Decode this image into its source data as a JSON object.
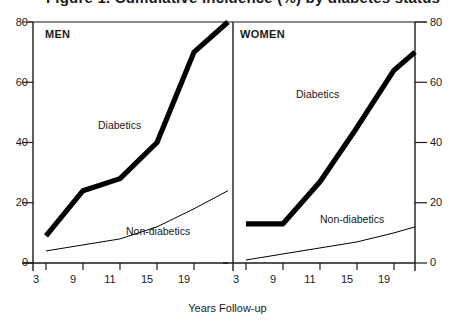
{
  "title": "Figure 1. Cumulative incidence (%) by diabetes status",
  "axis": {
    "y_ticks": [
      0,
      20,
      40,
      60,
      80
    ],
    "y_left_labels": [
      "0",
      "20",
      "40",
      "60",
      "80"
    ],
    "y_right_labels": [
      "0",
      "20",
      "40",
      "60",
      "80"
    ],
    "x_tick_labels": [
      "3",
      "9",
      "11",
      "15",
      "19"
    ],
    "x_title": "Years Follow-up"
  },
  "panels": {
    "men": {
      "title": "MEN",
      "label_diabetics": "Diabetics",
      "label_nondiabetics": "Non-diabetics"
    },
    "women": {
      "title": "WOMEN",
      "label_diabetics": "Diabetics",
      "label_nondiabetics": "Non-diabetics"
    }
  },
  "colors": {
    "line": "#000000",
    "axis": "#1a1a1a",
    "background": "#ffffff"
  },
  "chart_data": {
    "type": "line",
    "title": "Figure 1. Cumulative incidence (%) by diabetes status",
    "xlabel": "Years Follow-up",
    "ylabel": "",
    "ylim": [
      0,
      80
    ],
    "yticks": [
      0,
      20,
      40,
      60,
      80
    ],
    "grid": false,
    "legend": "inline-annotations",
    "panels": [
      {
        "name": "MEN",
        "x": [
          3,
          9,
          11,
          15,
          19,
          22
        ],
        "xtick_labels": [
          "3",
          "9",
          "11",
          "15",
          "19"
        ],
        "series": [
          {
            "name": "Diabetics",
            "values": [
              9,
              24,
              28,
              40,
              70,
              80
            ],
            "style": "thick"
          },
          {
            "name": "Non-diabetics",
            "values": [
              4,
              6,
              8,
              12,
              18,
              24
            ],
            "style": "thin"
          }
        ]
      },
      {
        "name": "WOMEN",
        "x": [
          3,
          9,
          11,
          15,
          19,
          22
        ],
        "xtick_labels": [
          "3",
          "9",
          "11",
          "15",
          "19"
        ],
        "series": [
          {
            "name": "Diabetics",
            "values": [
              13,
              13,
              27,
              45,
              64,
              70
            ],
            "style": "thick"
          },
          {
            "name": "Non-diabetics",
            "values": [
              1,
              3,
              5,
              7,
              10,
              12
            ],
            "style": "thin"
          }
        ]
      }
    ]
  }
}
